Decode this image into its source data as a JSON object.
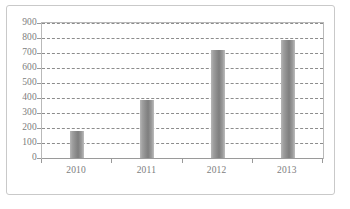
{
  "chart_data": {
    "type": "bar",
    "title": "",
    "subtitle": "",
    "xlabel": "",
    "ylabel": "",
    "categories": [
      "2010",
      "2011",
      "2012",
      "2013"
    ],
    "values": [
      180,
      390,
      720,
      790
    ],
    "series": [
      {
        "name": "",
        "values": [
          180,
          390,
          720,
          790
        ]
      }
    ],
    "ylim": [
      0,
      900
    ],
    "y_ticks": [
      0,
      100,
      200,
      300,
      400,
      500,
      600,
      700,
      800,
      900
    ],
    "y_tick_labels": [
      "0",
      "100",
      "200",
      "300",
      "400",
      "500",
      "600",
      "700",
      "800",
      "900"
    ],
    "grid": true,
    "grid_axis": "y",
    "grid_style": "dashed",
    "legend": false,
    "legend_position": "none",
    "bar_color": "#8a8a8a",
    "grid_color": "#8c8c8c",
    "axis_color": "#9a9a9a",
    "tick_label_color": "#7d7d7d",
    "frame_color": "#c9c9c9",
    "background_color": "#ffffff"
  }
}
